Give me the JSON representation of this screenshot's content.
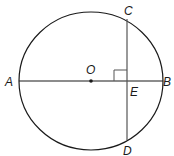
{
  "diagram": {
    "type": "circle-chord",
    "labels": {
      "A": "A",
      "B": "B",
      "C": "C",
      "D": "D",
      "E": "E",
      "O": "O"
    },
    "colors": {
      "stroke": "#1a1a1a",
      "chord": "#555555",
      "background": "#ffffff"
    }
  }
}
